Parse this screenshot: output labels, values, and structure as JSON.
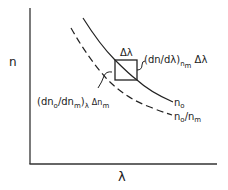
{
  "diagram": {
    "axes": {
      "y_label": "n",
      "x_label": "λ"
    },
    "box_top_label": "Δλ",
    "slope_annotation": {
      "prefix": "(dn/dλ)",
      "subscript": "n",
      "subscript_sub": "m",
      "suffix": " Δλ"
    },
    "derivative_annotation": {
      "prefix": "(dn",
      "prefix_sub": "o",
      "middle": "/dn",
      "middle_sub": "m",
      "close": ")",
      "close_sub": "λ",
      "delta": "Δn",
      "delta_sub": "m"
    },
    "curves": [
      {
        "name": "n_o",
        "label": "n",
        "label_sub": "o",
        "style": "solid"
      },
      {
        "name": "n_o/n_m",
        "label": "n",
        "label_sub": "o",
        "label_rest": "/n",
        "label_rest_sub": "m",
        "style": "dashed"
      }
    ],
    "colors": {
      "ink": "#222222",
      "background": "#ffffff"
    }
  }
}
